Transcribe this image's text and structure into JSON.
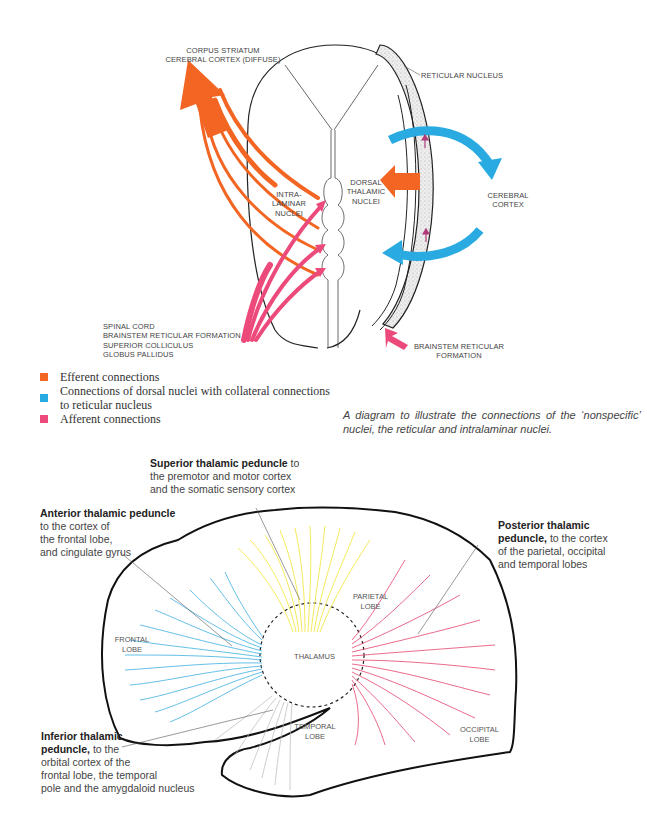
{
  "top_diagram": {
    "labels": {
      "efferent_target_line1": "CORPUS STRIATUM",
      "efferent_target_line2": "CEREBRAL CORTEX (DIFFUSE)",
      "reticular_nucleus": "RETICULAR NUCLEUS",
      "intralaminar_line1": "INTRA-",
      "intralaminar_line2": "LAMINAR",
      "intralaminar_line3": "NUCLEI",
      "dorsal_line1": "DORSAL",
      "dorsal_line2": "THALAMIC",
      "dorsal_line3": "NUCLEI",
      "cortex_line1": "CEREBRAL",
      "cortex_line2": "CORTEX",
      "afferent_sources": [
        "SPINAL CORD",
        "BRAINSTEM RETICULAR FORMATION",
        "SUPERIOR COLLICULUS",
        "GLOBUS PALLIDUS"
      ],
      "brainstem_line1": "BRAINSTEM RETICULAR",
      "brainstem_line2": "FORMATION"
    },
    "colors": {
      "efferent": "#f26522",
      "dorsal": "#29abe2",
      "afferent": "#ec4a7b"
    }
  },
  "legend": {
    "items": [
      {
        "label": "Efferent connections",
        "color": "#f26522"
      },
      {
        "label": "Connections of dorsal nuclei with collateral connections to reticular nucleus",
        "color": "#29abe2"
      },
      {
        "label": "Afferent connections",
        "color": "#ec4a7b"
      }
    ]
  },
  "caption": "A diagram to illustrate the connections of the ‘nonspecific’ nuclei, the reticular and intralaminar nuclei.",
  "bottom_diagram": {
    "superior": {
      "title": "Superior thalamic peduncle",
      "rest1": " to",
      "line2": "the premotor and motor cortex",
      "line3": "and the somatic sensory cortex"
    },
    "anterior": {
      "title": "Anterior thalamic peduncle",
      "line2": "to the cortex of",
      "line3": "the frontal lobe,",
      "line4": "and cingulate gyrus"
    },
    "posterior": {
      "title1": "Posterior thalamic",
      "title2": "peduncle,",
      "rest2": " to the cortex",
      "line3": "of the parietal, occipital",
      "line4": "and temporal lobes"
    },
    "inferior": {
      "title1": "Inferior thalamic",
      "title2": "peduncle,",
      "rest2": " to the",
      "line3": "orbital cortex of the",
      "line4": "frontal lobe, the temporal",
      "line5": "pole and the amygdaloid nucleus"
    },
    "lobes": {
      "frontal_1": "FRONTAL",
      "frontal_2": "LOBE",
      "parietal_1": "PARIETAL",
      "parietal_2": "LOBE",
      "temporal_1": "TEMPORAL",
      "temporal_2": "LOBE",
      "occipital_1": "OCCIPITAL",
      "occipital_2": "LOBE",
      "thalamus": "THALAMUS"
    },
    "colors": {
      "anterior": "#2aa8de",
      "superior": "#f2e84a",
      "posterior": "#e5446d",
      "inferior": "#b8b8b8"
    }
  }
}
